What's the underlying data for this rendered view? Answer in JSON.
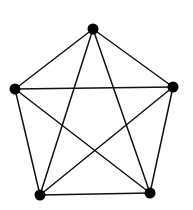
{
  "diagram": {
    "type": "complete-graph",
    "name": "K5",
    "canvas": {
      "width": 193,
      "height": 210
    },
    "colors": {
      "background": "#ffffff",
      "edge": "#111111",
      "vertex": "#000000"
    },
    "vertex_radius": 5.5,
    "edge_width": 1.5,
    "vertices": [
      {
        "id": "top",
        "x": 93,
        "y": 29
      },
      {
        "id": "right",
        "x": 173,
        "y": 87
      },
      {
        "id": "bottom-right",
        "x": 150,
        "y": 193
      },
      {
        "id": "bottom-left",
        "x": 40,
        "y": 195
      },
      {
        "id": "left",
        "x": 15,
        "y": 89
      }
    ],
    "edges": [
      [
        "top",
        "right"
      ],
      [
        "top",
        "bottom-right"
      ],
      [
        "top",
        "bottom-left"
      ],
      [
        "top",
        "left"
      ],
      [
        "right",
        "bottom-right"
      ],
      [
        "right",
        "bottom-left"
      ],
      [
        "right",
        "left"
      ],
      [
        "bottom-right",
        "bottom-left"
      ],
      [
        "bottom-right",
        "left"
      ],
      [
        "bottom-left",
        "left"
      ]
    ]
  }
}
